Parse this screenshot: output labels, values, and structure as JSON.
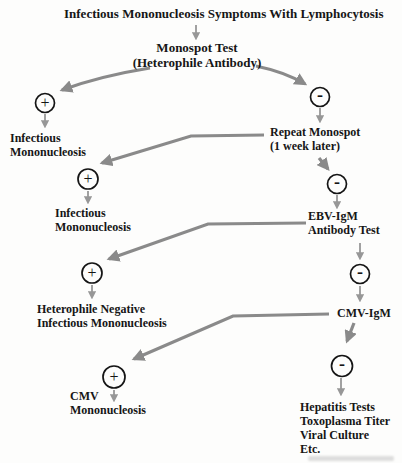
{
  "diagram": {
    "title": "Infectious Mononucleosis Symptoms With Lymphocytosis",
    "nodes": {
      "monospot": {
        "line1": "Monospot Test",
        "line2": "(Heterophile Antibody)"
      },
      "im1": {
        "line1": "Infectious",
        "line2": "Mononucleosis"
      },
      "repeat_monospot": {
        "line1": "Repeat Monospot",
        "line2": "(1 week later)"
      },
      "im2": {
        "line1": "Infectious",
        "line2": "Mononucleosis"
      },
      "ebv_igm": {
        "line1": "EBV-IgM",
        "line2": "Antibody Test"
      },
      "het_neg": {
        "line1": "Heterophile Negative",
        "line2": "Infectious Mononucleosis"
      },
      "cmv_igm": {
        "line1": "CMV-IgM"
      },
      "cmv_mono": {
        "line1": "CMV",
        "line2": "Mononucleosis"
      },
      "workup": {
        "line1": "Hepatitis Tests",
        "line2": "Toxoplasma Titer",
        "line3": "Viral Culture",
        "line4": "Etc."
      }
    },
    "symbols": {
      "positive": "+",
      "negative": "-"
    },
    "colors": {
      "arrow_gray": "#8a8a8a",
      "text_black": "#161616",
      "circle_black": "#151515",
      "background": "#fdfdfc"
    }
  }
}
